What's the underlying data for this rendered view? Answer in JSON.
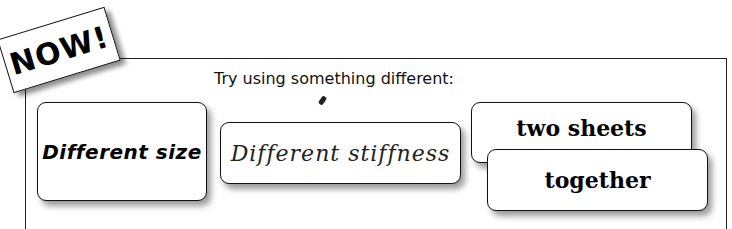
{
  "badge": {
    "label": "NOW!"
  },
  "prompt": {
    "text": "Try using something different:"
  },
  "cards": [
    {
      "label": "Different size"
    },
    {
      "label": "Different stiffness"
    },
    {
      "label": "two sheets"
    },
    {
      "label": "together"
    }
  ],
  "colors": {
    "background": "#ffffff",
    "ink": "#111111"
  }
}
